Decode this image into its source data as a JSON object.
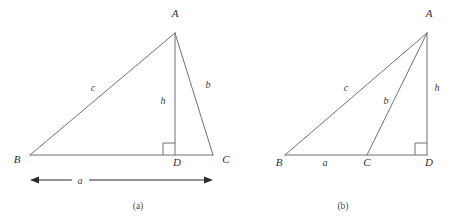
{
  "figure": {
    "background_color": "#ffffff",
    "line_color": "#6f7072",
    "label_color": "#2f2f2f",
    "dimension_color": "#2b2b2b",
    "panels": [
      {
        "id": "a",
        "caption": "(a)",
        "description": "Acute triangle ABC with altitude AD from A to base BC, foot D between B and C",
        "vertices": [
          {
            "name": "A",
            "label": "A",
            "x": 175,
            "y": 33
          },
          {
            "name": "B",
            "label": "B",
            "x": 30,
            "y": 155
          },
          {
            "name": "C",
            "label": "C",
            "x": 213,
            "y": 155
          },
          {
            "name": "D",
            "label": "D",
            "x": 175,
            "y": 155
          }
        ],
        "vertex_label_positions": [
          {
            "name": "A",
            "x": 175,
            "y": 17
          },
          {
            "name": "B",
            "x": 17,
            "y": 163
          },
          {
            "name": "C",
            "x": 226,
            "y": 163
          },
          {
            "name": "D",
            "x": 177,
            "y": 166
          }
        ],
        "segments": [
          {
            "name": "side-c",
            "from": "B",
            "to": "A"
          },
          {
            "name": "side-b",
            "from": "A",
            "to": "C"
          },
          {
            "name": "base-BC",
            "from": "B",
            "to": "C"
          },
          {
            "name": "altitude-h",
            "from": "A",
            "to": "D"
          }
        ],
        "side_labels": [
          {
            "name": "c",
            "label": "c",
            "x": 93,
            "y": 91
          },
          {
            "name": "h",
            "label": "h",
            "x": 163,
            "y": 104
          },
          {
            "name": "b",
            "label": "b",
            "x": 208,
            "y": 88
          }
        ],
        "right_angle": {
          "at": "D",
          "size": 12,
          "side": "left"
        },
        "dimension": {
          "name": "a",
          "label": "a",
          "label_x": 80,
          "label_y": 184,
          "y": 180,
          "x_start": 30,
          "x_end": 213,
          "arrows": "both"
        },
        "caption_x": 138,
        "caption_y": 209
      },
      {
        "id": "b",
        "caption": "(b)",
        "description": "Obtuse triangle ABC with altitude AD falling outside the triangle, foot D beyond C on line BC extended",
        "vertices": [
          {
            "name": "A",
            "label": "A",
            "x": 427,
            "y": 33
          },
          {
            "name": "B",
            "label": "B",
            "x": 285,
            "y": 155
          },
          {
            "name": "C",
            "label": "C",
            "x": 367,
            "y": 155
          },
          {
            "name": "D",
            "label": "D",
            "x": 427,
            "y": 155
          }
        ],
        "vertex_label_positions": [
          {
            "name": "A",
            "x": 429,
            "y": 17
          },
          {
            "name": "B",
            "x": 279,
            "y": 166
          },
          {
            "name": "C",
            "x": 367,
            "y": 166
          },
          {
            "name": "D",
            "x": 429,
            "y": 166
          }
        ],
        "segments": [
          {
            "name": "side-c",
            "from": "B",
            "to": "A"
          },
          {
            "name": "side-b",
            "from": "C",
            "to": "A"
          },
          {
            "name": "base-BD",
            "from": "B",
            "to": "D"
          },
          {
            "name": "altitude-h",
            "from": "A",
            "to": "D"
          }
        ],
        "side_labels": [
          {
            "name": "c",
            "label": "c",
            "x": 346,
            "y": 91
          },
          {
            "name": "b",
            "label": "b",
            "x": 386,
            "y": 104
          },
          {
            "name": "h",
            "label": "h",
            "x": 437,
            "y": 91
          },
          {
            "name": "a",
            "label": "a",
            "x": 325,
            "y": 166
          }
        ],
        "right_angle": {
          "at": "D",
          "size": 12,
          "side": "left"
        },
        "caption_x": 343,
        "caption_y": 209
      }
    ]
  }
}
